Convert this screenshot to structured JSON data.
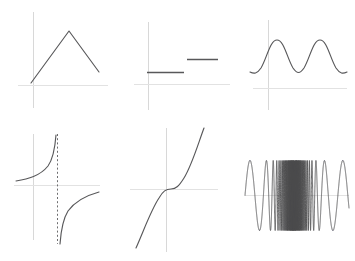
{
  "figure": {
    "background_color": "#ffffff",
    "curve_color": "#58585a",
    "axis_color": "#d8d8d8",
    "asymptote_color": "#6d6d6f",
    "layout": {
      "rows": 2,
      "columns": 3,
      "panel_count": 6
    }
  },
  "chart_data": [
    {
      "type": "line",
      "title": "",
      "name": "triangular-peak",
      "description": "Piecewise linear tent function rising to a peak then falling",
      "xlabel": "",
      "ylabel": "",
      "xlim": [
        -0.4,
        3.2
      ],
      "ylim": [
        -0.25,
        2.3
      ],
      "grid": false,
      "legend": "none",
      "x": [
        0.0,
        1.45,
        3.0
      ],
      "values": [
        0.08,
        2.05,
        0.55
      ]
    },
    {
      "type": "line",
      "title": "",
      "name": "step-function",
      "description": "Two disjoint horizontal segments forming a jump discontinuity",
      "xlabel": "",
      "ylabel": "",
      "xlim": [
        -0.4,
        3.2
      ],
      "ylim": [
        -0.25,
        2.3
      ],
      "grid": false,
      "legend": "none",
      "series": [
        {
          "name": "lower-step",
          "x": [
            0.02,
            1.45
          ],
          "values": [
            0.42,
            0.42
          ]
        },
        {
          "name": "upper-step",
          "x": [
            1.52,
            2.72
          ],
          "values": [
            0.85,
            0.85
          ]
        }
      ]
    },
    {
      "type": "line",
      "title": "",
      "name": "sine-wave",
      "description": "Two periods of a raised sinusoid lying above the x-axis",
      "xlabel": "",
      "ylabel": "",
      "xlim": [
        -0.5,
        4.6
      ],
      "ylim": [
        -0.3,
        2.3
      ],
      "grid": false,
      "legend": "none",
      "periods": 2,
      "amplitude": 0.75,
      "offset": 1.05,
      "x": [
        -0.3,
        0.2,
        0.7,
        1.2,
        1.7,
        2.2,
        2.7,
        3.2,
        3.7,
        4.2
      ],
      "values": [
        0.33,
        0.62,
        1.75,
        1.62,
        0.43,
        0.68,
        1.78,
        1.55,
        0.4,
        0.52
      ]
    },
    {
      "type": "line",
      "title": "",
      "name": "rational-hyperbola",
      "description": "Reciprocal curve with a vertical dashed asymptote; two branches",
      "xlabel": "",
      "ylabel": "",
      "xlim": [
        -1.8,
        2.6
      ],
      "ylim": [
        -2.3,
        2.3
      ],
      "grid": false,
      "legend": "none",
      "asymptote_x": 0.55,
      "series": [
        {
          "name": "left-branch",
          "x": [
            -1.7,
            -1.0,
            -0.3,
            0.2,
            0.45
          ],
          "values": [
            0.22,
            0.32,
            0.58,
            1.25,
            2.15
          ]
        },
        {
          "name": "right-branch",
          "x": [
            0.66,
            0.85,
            1.2,
            1.8,
            2.5
          ],
          "values": [
            -2.15,
            -1.25,
            -0.62,
            -0.32,
            -0.21
          ]
        }
      ]
    },
    {
      "type": "line",
      "title": "",
      "name": "cubic-curve",
      "description": "Odd cubic polynomial with a flat inflection point at the origin",
      "xlabel": "",
      "ylabel": "",
      "xlim": [
        -2.3,
        1.9
      ],
      "ylim": [
        -2.5,
        2.5
      ],
      "grid": false,
      "legend": "none",
      "x": [
        -2.1,
        -1.6,
        -1.1,
        -0.6,
        -0.1,
        0.4,
        0.9,
        1.4,
        1.7
      ],
      "values": [
        -2.35,
        -1.45,
        -0.62,
        -0.12,
        0.02,
        0.14,
        0.62,
        1.75,
        2.45
      ]
    },
    {
      "type": "line",
      "title": "",
      "name": "chirp-oscillation",
      "description": "Frequency sweep: oscillation density increases sharply toward the centre",
      "xlabel": "",
      "ylabel": "",
      "xlim": [
        -2.6,
        2.6
      ],
      "ylim": [
        -1.5,
        1.5
      ],
      "grid": false,
      "legend": "none",
      "amplitude": 1.0,
      "center_x": -0.15,
      "min_frequency": 1.0,
      "max_frequency": 60.0
    }
  ]
}
